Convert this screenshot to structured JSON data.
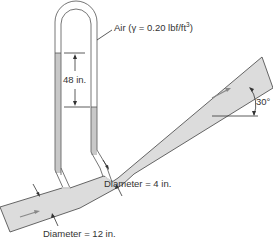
{
  "diagram": {
    "type": "venturi-meter-with-inverted-u-tube-manometer",
    "labels": {
      "air": "Air (γ = 0.20 lbf/ft",
      "air_exp": "3",
      "air_close": ")",
      "height": "48 in.",
      "throat_diameter": "Diameter = 4 in.",
      "inlet_diameter": "Diameter = 12 in.",
      "angle": "30°"
    },
    "colors": {
      "pipe_fill": "#dcdcdc",
      "liquid_fill": "#c8c8c8",
      "outline": "#555555",
      "text": "#333333"
    }
  }
}
